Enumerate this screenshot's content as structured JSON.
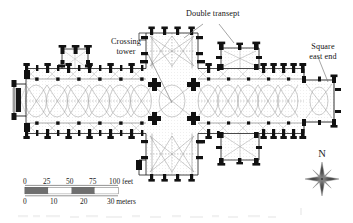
{
  "figure": {
    "type": "architectural-floor-plan",
    "orientation": "north-up"
  },
  "annotations": [
    {
      "id": "double-transept",
      "label": "Double transept",
      "lines": [
        "Double transept"
      ]
    },
    {
      "id": "crossing-tower",
      "label": "Crossing tower",
      "lines": [
        "Crossing",
        "tower"
      ]
    },
    {
      "id": "square-east-end",
      "label": "Square east end",
      "lines": [
        "Square",
        "east end"
      ]
    }
  ],
  "scale_bar": {
    "feet": {
      "ticks": [
        "0",
        "25",
        "50",
        "75",
        "100"
      ],
      "unit": "feet",
      "unit_label": "100 feet",
      "max": 100
    },
    "meters": {
      "ticks": [
        "0",
        "10",
        "20",
        "30"
      ],
      "unit": "meters",
      "unit_label": "30 meters",
      "max": 30
    },
    "segment_fill_dark": "#6f6f6f",
    "segment_fill_light": "#ffffff",
    "outline": "#2b2b2b"
  },
  "compass": {
    "north_label": "N",
    "points": 8,
    "icon": "compass-rose-icon"
  },
  "colors": {
    "wall_black": "#111111",
    "vault_line": "#9a9a9a",
    "hatch_grey": "#cfcfcf",
    "paper": "#ffffff",
    "leader_line": "#6d6d6d"
  },
  "plan_features": [
    "west front with projecting porch",
    "aisled nave of ten bays",
    "north porch / chapel",
    "main crossing with four cruciform piers",
    "great transept north and south arms",
    "eastern (second) transept",
    "aisled choir",
    "square east end"
  ]
}
